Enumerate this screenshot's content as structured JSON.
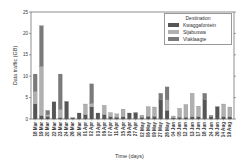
{
  "chart_data": {
    "type": "bar",
    "stacked": true,
    "title": "",
    "xlabel": "Time (days)",
    "ylabel": "Data traffic (GB)",
    "ylim": [
      0,
      25
    ],
    "yticks": [
      0,
      5,
      10,
      15,
      20,
      25
    ],
    "grid": false,
    "legend_position": "upper right",
    "legend_title": "Destination",
    "categories": [
      "18 Mar",
      "19 Mar",
      "20 Mar",
      "22 Mar",
      "23 Mar",
      "24 Mar",
      "26 Mar",
      "30 Mar",
      "01 Apr",
      "02 Apr",
      "03 Apr",
      "06 Apr",
      "07 Apr",
      "11 Apr",
      "15 Apr",
      "26 Apr",
      "27 Apr",
      "02 May",
      "06 May",
      "09 May",
      "27 May",
      "28 May",
      "04 Jun",
      "05 Jun",
      "12 Jun",
      "13 Jun",
      "17 Jun",
      "18 Jun",
      "24 Jun",
      "26 Jun",
      "14 Aug",
      "19 Aug"
    ],
    "series": [
      {
        "name": "Kwaggafontein",
        "color": "#555555",
        "values": [
          3.5,
          0.8,
          0.6,
          4.0,
          0.3,
          4.1,
          0.3,
          1.4,
          1.0,
          2.8,
          1.4,
          1.0,
          0.5,
          0.4,
          0.5,
          1.4,
          1.5,
          0.4,
          0.6,
          0.6,
          4.5,
          2.0,
          0.3,
          0.4,
          0.4,
          0.5,
          0.5,
          4.5,
          0.6,
          2.9,
          0.5,
          0.5
        ]
      },
      {
        "name": "Sijabuswa",
        "color": "#b0b0b0",
        "values": [
          3.0,
          11.5,
          0.4,
          0.0,
          2.0,
          0.0,
          0.0,
          0.0,
          2.5,
          0.9,
          0.0,
          2.2,
          1.0,
          0.8,
          1.8,
          0.0,
          0.0,
          0.5,
          2.3,
          2.2,
          0.0,
          2.5,
          0.4,
          2.1,
          3.0,
          5.5,
          2.5,
          0.0,
          0.3,
          0.0,
          3.0,
          2.3
        ]
      },
      {
        "name": "Vlaklaagte",
        "color": "#7a7a7a",
        "values": [
          4.0,
          9.5,
          1.0,
          0.0,
          8.2,
          0.0,
          0.0,
          0.0,
          0.0,
          4.5,
          0.0,
          0.0,
          0.0,
          0.0,
          0.0,
          0.0,
          0.0,
          0.0,
          0.0,
          0.0,
          1.5,
          3.0,
          0.0,
          0.0,
          0.0,
          0.0,
          0.0,
          1.5,
          0.0,
          0.0,
          0.0,
          0.0
        ]
      }
    ]
  },
  "legend": {
    "title": "Destination",
    "items": [
      {
        "label": "Kwaggafontein",
        "color": "#555555"
      },
      {
        "label": "Sijabuswa",
        "color": "#b0b0b0"
      },
      {
        "label": "Vlaklaagte",
        "color": "#7a7a7a"
      }
    ]
  },
  "axes": {
    "xlabel": "Time (days)",
    "ylabel": "Data traffic (GB)"
  }
}
